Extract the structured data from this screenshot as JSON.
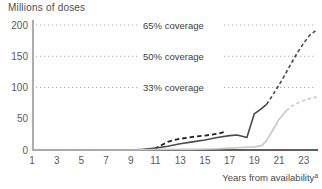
{
  "title": "Millions of doses",
  "x_axis": {
    "label": "Years from availability",
    "label_sup": "a",
    "ticks": [
      1,
      3,
      5,
      7,
      9,
      11,
      13,
      15,
      17,
      19,
      21,
      23
    ]
  },
  "y_axis": {
    "ticks": [
      0,
      50,
      100,
      150,
      200
    ]
  },
  "coverage_lines": [
    {
      "value": 200,
      "label": "65% coverage"
    },
    {
      "value": 150,
      "label": "50% coverage"
    },
    {
      "value": 100,
      "label": "33% coverage"
    }
  ],
  "colors": {
    "dark_line": "#4a4a4a",
    "light_line": "#c9c9c9",
    "short_dash_line": "#222222",
    "gridline": "#ababab",
    "x_axis_line": "#5f5f5f",
    "y_axis_line": "#8a8a8a",
    "background": "#ffffff"
  },
  "chart_data": {
    "type": "line",
    "title": "Millions of doses",
    "xlabel": "Years from availability",
    "ylabel": "Millions of doses",
    "xlim": [
      1,
      24.2
    ],
    "ylim": [
      0,
      200
    ],
    "grid": "horizontal dotted reference lines only",
    "legend": "none",
    "reference_lines": [
      {
        "value": 200,
        "label": "65% coverage"
      },
      {
        "value": 150,
        "label": "50% coverage"
      },
      {
        "value": 100,
        "label": "33% coverage"
      }
    ],
    "series": [
      {
        "name": "short-dashed-black-segment",
        "style": "dashed",
        "color": "#222222",
        "width": 1.8,
        "dash": "4.5,3",
        "points": [
          [
            10.9,
            2
          ],
          [
            11.5,
            8
          ],
          [
            12,
            13
          ],
          [
            12.5,
            16
          ],
          [
            13,
            18
          ],
          [
            14,
            21
          ],
          [
            15,
            23
          ],
          [
            16,
            26
          ],
          [
            16.6,
            29
          ]
        ]
      },
      {
        "name": "dark-line-actual",
        "style": "solid",
        "color": "#4a4a4a",
        "width": 1.6,
        "dash": null,
        "points": [
          [
            1,
            0
          ],
          [
            5,
            0
          ],
          [
            9,
            0
          ],
          [
            10,
            1
          ],
          [
            11,
            3
          ],
          [
            12,
            6
          ],
          [
            13,
            10
          ],
          [
            14,
            13
          ],
          [
            15,
            16
          ],
          [
            16,
            20
          ],
          [
            17,
            23
          ],
          [
            17.6,
            24
          ],
          [
            18.4,
            20
          ],
          [
            19,
            58
          ],
          [
            19.5,
            65
          ],
          [
            20,
            73
          ]
        ]
      },
      {
        "name": "dark-line-projection",
        "style": "dashed",
        "color": "#4a4a4a",
        "width": 1.6,
        "dash": "3.5,2.6",
        "points": [
          [
            20,
            73
          ],
          [
            20.5,
            88
          ],
          [
            21,
            104
          ],
          [
            21.5,
            121
          ],
          [
            22,
            139
          ],
          [
            22.5,
            156
          ],
          [
            23,
            171
          ],
          [
            23.5,
            184
          ],
          [
            24.1,
            193
          ]
        ]
      },
      {
        "name": "light-line-actual",
        "style": "solid",
        "color": "#c9c9c9",
        "width": 1.6,
        "dash": null,
        "points": [
          [
            1,
            0
          ],
          [
            5,
            0
          ],
          [
            9,
            0
          ],
          [
            12,
            1
          ],
          [
            14,
            1
          ],
          [
            16,
            2
          ],
          [
            17,
            3
          ],
          [
            18,
            4
          ],
          [
            19,
            5
          ],
          [
            19.6,
            7
          ],
          [
            20,
            15
          ],
          [
            20.5,
            32
          ],
          [
            21,
            49
          ],
          [
            21.6,
            63
          ]
        ]
      },
      {
        "name": "light-line-projection",
        "style": "dashed",
        "color": "#c9c9c9",
        "width": 1.6,
        "dash": "3.5,2.6",
        "points": [
          [
            21.6,
            63
          ],
          [
            22,
            70
          ],
          [
            22.5,
            75
          ],
          [
            23,
            79
          ],
          [
            23.6,
            83
          ],
          [
            24.1,
            85
          ]
        ]
      }
    ]
  }
}
